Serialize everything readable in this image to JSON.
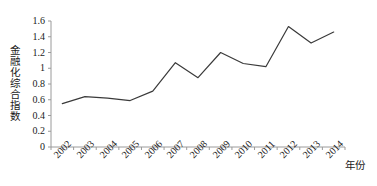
{
  "chart_data": {
    "type": "line",
    "title": "",
    "xlabel": "年份",
    "ylabel": "金融化综合指数",
    "categories": [
      "2002",
      "2003",
      "2004",
      "2005",
      "2006",
      "2007",
      "2008",
      "2009",
      "2010",
      "2011",
      "2012",
      "2013",
      "2014"
    ],
    "values": [
      0.55,
      0.64,
      0.62,
      0.59,
      0.71,
      1.07,
      0.88,
      1.2,
      1.06,
      1.02,
      1.53,
      1.32,
      1.46
    ],
    "series": [
      {
        "name": "金融化综合指数",
        "values": [
          0.55,
          0.64,
          0.62,
          0.59,
          0.71,
          1.07,
          0.88,
          1.2,
          1.06,
          1.02,
          1.53,
          1.32,
          1.46
        ]
      }
    ],
    "ylim": [
      0,
      1.6
    ],
    "y_ticks": [
      "0",
      "0.2",
      "0.4",
      "0.6",
      "0.8",
      "1",
      "1.2",
      "1.4",
      "1.6"
    ],
    "y_tick_values": [
      0,
      0.2,
      0.4,
      0.6,
      0.8,
      1,
      1.2,
      1.4,
      1.6
    ],
    "grid": false,
    "legend": "none",
    "line_color": "#3a3a3a",
    "axis_color": "#9a9a9a",
    "background_color": "#ffffff"
  }
}
